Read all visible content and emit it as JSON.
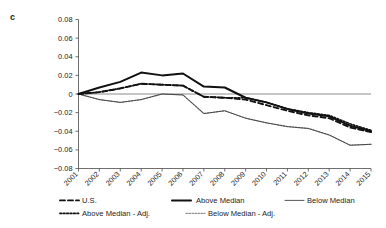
{
  "figure": {
    "panel_label": "c"
  },
  "chart_data": {
    "type": "line",
    "title": "",
    "xlabel": "",
    "ylabel": "",
    "grid": false,
    "legend_position": "bottom",
    "xlim": [
      2001,
      2015
    ],
    "ylim": [
      -0.08,
      0.08
    ],
    "ytick_labels": [
      "0.08",
      "0.06",
      "0.04",
      "0.02",
      "0",
      "−0.02",
      "−0.04",
      "−0.06",
      "−0.08"
    ],
    "ytick_values": [
      0.08,
      0.06,
      0.04,
      0.02,
      0,
      -0.02,
      -0.04,
      -0.06,
      -0.08
    ],
    "categories": [
      2001,
      2002,
      2003,
      2004,
      2005,
      2006,
      2007,
      2008,
      2009,
      2010,
      2011,
      2012,
      2013,
      2014,
      2015
    ],
    "xtick_labels": [
      "2001",
      "2002",
      "2003",
      "2004",
      "2005",
      "2006",
      "2007",
      "2008",
      "2009",
      "2010",
      "2011",
      "2012",
      "2013",
      "2014",
      "2015"
    ],
    "series": [
      {
        "name": "U.S.",
        "style": "dashed",
        "color": "#111111",
        "width": 1.9,
        "dash": "5,3",
        "values": [
          0.0,
          0.002,
          0.006,
          0.011,
          0.01,
          0.009,
          -0.003,
          -0.004,
          -0.006,
          -0.012,
          -0.018,
          -0.023,
          -0.026,
          -0.036,
          -0.041
        ]
      },
      {
        "name": "Above Median",
        "style": "solid-thick",
        "color": "#111111",
        "width": 2.0,
        "dash": "",
        "values": [
          0.0,
          0.007,
          0.013,
          0.023,
          0.02,
          0.022,
          0.008,
          0.007,
          -0.004,
          -0.009,
          -0.016,
          -0.021,
          -0.024,
          -0.034,
          -0.04
        ]
      },
      {
        "name": "Below Median",
        "style": "solid-thin",
        "color": "#3a3a3a",
        "width": 0.85,
        "dash": "",
        "values": [
          0.0,
          -0.006,
          -0.009,
          -0.006,
          0.0,
          -0.001,
          -0.021,
          -0.018,
          -0.026,
          -0.031,
          -0.035,
          -0.037,
          -0.044,
          -0.055,
          -0.054
        ]
      },
      {
        "name": "Above Median - Adj.",
        "style": "dotted",
        "color": "#111111",
        "width": 1.7,
        "dash": "1.6,1.8",
        "values": [
          0.0,
          0.002,
          0.006,
          0.011,
          0.01,
          0.009,
          -0.003,
          -0.004,
          -0.004,
          -0.009,
          -0.016,
          -0.02,
          -0.023,
          -0.032,
          -0.039
        ]
      },
      {
        "name": "Below Median - Adj.",
        "style": "dotted-light",
        "color": "#8c8c8c",
        "width": 1.2,
        "dash": "1.4,1.6",
        "values": [
          0.0,
          -0.006,
          -0.009,
          -0.006,
          0.0,
          -0.001,
          -0.021,
          -0.018,
          -0.026,
          -0.031,
          -0.035,
          -0.037,
          -0.044,
          -0.055,
          -0.054
        ]
      }
    ],
    "legend": [
      {
        "label": "U.S.",
        "marker": "dashed"
      },
      {
        "label": "Above Median",
        "marker": "solid-thick"
      },
      {
        "label": "Below Median",
        "marker": "solid-thin"
      },
      {
        "label": "Above Median - Adj.",
        "marker": "dotted"
      },
      {
        "label": "Below Median - Adj.",
        "marker": "dotted-light"
      }
    ]
  }
}
